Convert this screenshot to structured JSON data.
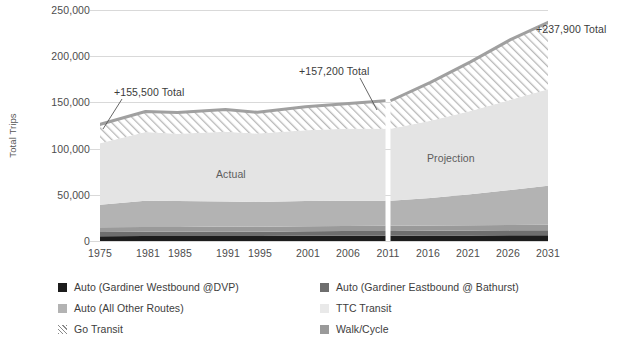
{
  "chart_data": {
    "type": "area",
    "title": "",
    "xlabel": "",
    "ylabel": "Total Trips",
    "ylim": [
      0,
      250000
    ],
    "ytick_labels": [
      "0",
      "50,000",
      "100,000",
      "150,000",
      "200,000",
      "250,000"
    ],
    "ytick_values": [
      0,
      50000,
      100000,
      150000,
      200000,
      250000
    ],
    "grid": true,
    "legend_position": "bottom",
    "stacked": true,
    "categories": [
      "1975",
      "1981",
      "1985",
      "1991",
      "1995",
      "2001",
      "2006",
      "2011",
      "2016",
      "2021",
      "2026",
      "2031"
    ],
    "x": [
      1975,
      1981,
      1985,
      1991,
      1995,
      2001,
      2006,
      2011,
      2016,
      2021,
      2026,
      2031
    ],
    "series": [
      {
        "name": "Auto (Gardiner Westbound @DVP)",
        "color": "#1c1c1c",
        "values": [
          5200,
          5400,
          5300,
          5500,
          5400,
          5600,
          5700,
          5800,
          5900,
          6000,
          6100,
          6200
        ]
      },
      {
        "name": "Auto (Gardiner Eastbound @ Bathurst)",
        "color": "#6e6e6e",
        "values": [
          4600,
          4700,
          4700,
          4800,
          4700,
          4900,
          5000,
          5100,
          5200,
          5300,
          5400,
          5500
        ]
      },
      {
        "name": "Auto (All Other Routes)",
        "color": "#b3b3b3",
        "values": [
          24200,
          28400,
          28000,
          27200,
          26900,
          27500,
          27300,
          27100,
          29800,
          33500,
          37900,
          42300
        ]
      },
      {
        "name": "TTC Transit",
        "color": "#e4e4e4",
        "values": [
          66000,
          74500,
          73000,
          75500,
          74000,
          76500,
          78000,
          78000,
          83500,
          90000,
          97500,
          105000
        ]
      },
      {
        "name": "Go Transit",
        "color": "hatch",
        "values": [
          20500,
          22000,
          23000,
          24000,
          23000,
          25500,
          27000,
          30200,
          41600,
          53200,
          65100,
          72900
        ]
      },
      {
        "name": "Walk/Cycle",
        "color": "#9a9a9a",
        "values": [
          5000,
          5100,
          5200,
          5300,
          5300,
          5400,
          5500,
          5600,
          5700,
          5800,
          5900,
          6000
        ]
      }
    ],
    "totals": [
      125500,
      140100,
      139200,
      142300,
      139300,
      145400,
      148500,
      157200,
      171700,
      193800,
      218900,
      237900
    ],
    "annotations": [
      {
        "text": "+155,500 Total",
        "x_year": 1975,
        "value": 155500
      },
      {
        "text": "+157,200 Total",
        "x_year": 2011,
        "value": 157200
      },
      {
        "text": "+237,900 Total",
        "x_year": 2031,
        "value": 237900
      }
    ],
    "region_labels": [
      {
        "text": "Actual",
        "range": [
          1975,
          2011
        ]
      },
      {
        "text": "Projection",
        "range": [
          2011,
          2031
        ]
      }
    ]
  },
  "legend": {
    "items": [
      {
        "label": "Auto (Gardiner Westbound @DVP)",
        "swatch": "#1c1c1c"
      },
      {
        "label": "Auto (Gardiner Eastbound @ Bathurst)",
        "swatch": "#6e6e6e"
      },
      {
        "label": "Auto (All Other Routes)",
        "swatch": "#b3b3b3"
      },
      {
        "label": "TTC Transit",
        "swatch": "#e9e9e9"
      },
      {
        "label": "Go Transit",
        "swatch": "hatch"
      },
      {
        "label": "Walk/Cycle",
        "swatch": "#9a9a9a"
      }
    ]
  }
}
